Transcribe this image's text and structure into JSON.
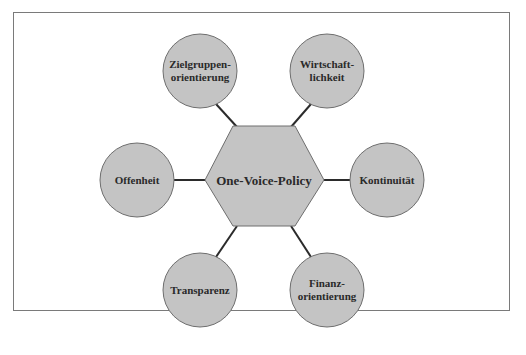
{
  "diagram": {
    "center": {
      "label": "One-Voice-Policy",
      "x": 264,
      "y": 180
    },
    "nodes": [
      {
        "id": "zielgruppen",
        "lines": [
          "Zielgruppen-",
          "orientierung"
        ],
        "x": 200,
        "y": 71
      },
      {
        "id": "wirtschaft",
        "lines": [
          "Wirtschaft-",
          "lichkeit"
        ],
        "x": 327,
        "y": 71
      },
      {
        "id": "offenheit",
        "lines": [
          "Offenheit"
        ],
        "x": 137,
        "y": 180
      },
      {
        "id": "kontinuitaet",
        "lines": [
          "Kontinuität"
        ],
        "x": 387,
        "y": 180
      },
      {
        "id": "transparenz",
        "lines": [
          "Transparenz"
        ],
        "x": 200,
        "y": 290
      },
      {
        "id": "finanz",
        "lines": [
          "Finanz-",
          "orientierung"
        ],
        "x": 327,
        "y": 290
      }
    ],
    "colors": {
      "fill": "#c4c4c4",
      "stroke": "#6e6e6e",
      "connector": "#2b2b2b",
      "text": "#2a2a2a"
    }
  },
  "labels": {
    "center": "One-Voice-Policy",
    "n0a": "Zielgruppen-",
    "n0b": "orientierung",
    "n1a": "Wirtschaft-",
    "n1b": "lichkeit",
    "n2": "Offenheit",
    "n3": "Kontinuität",
    "n4": "Transparenz",
    "n5a": "Finanz-",
    "n5b": "orientierung"
  }
}
